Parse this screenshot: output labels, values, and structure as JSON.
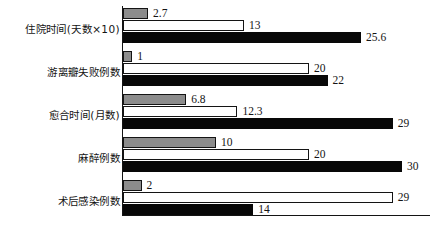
{
  "chart_data": {
    "type": "bar",
    "orientation": "horizontal",
    "title": "",
    "subtitle": "",
    "xlabel": "",
    "ylabel": "",
    "grid": false,
    "legend": "none",
    "xlim": [
      0,
      33
    ],
    "categories": [
      "住院时间(天数×10)",
      "游离瓣失败例数",
      "愈合时间(月数)",
      "麻醉例数",
      "术后感染例数"
    ],
    "series": [
      {
        "name": "series-1",
        "color": "#8c8c8c",
        "values": [
          2.7,
          1,
          6.8,
          10,
          2
        ]
      },
      {
        "name": "series-2",
        "color": "#ffffff",
        "values": [
          13,
          20,
          12.3,
          20,
          29
        ]
      },
      {
        "name": "series-3",
        "color": "#080808",
        "values": [
          25.6,
          22,
          29,
          30,
          14
        ]
      }
    ],
    "value_labels": [
      [
        "2.7",
        "13",
        "25.6"
      ],
      [
        "1",
        "20",
        "22"
      ],
      [
        "6.8",
        "12.3",
        "29"
      ],
      [
        "10",
        "20",
        "30"
      ],
      [
        "2",
        "29",
        "14"
      ]
    ]
  },
  "colors": {
    "series_gray": "#8c8c8c",
    "series_white": "#ffffff",
    "series_black": "#080808",
    "axis": "#141414",
    "background": "#ffffff"
  }
}
